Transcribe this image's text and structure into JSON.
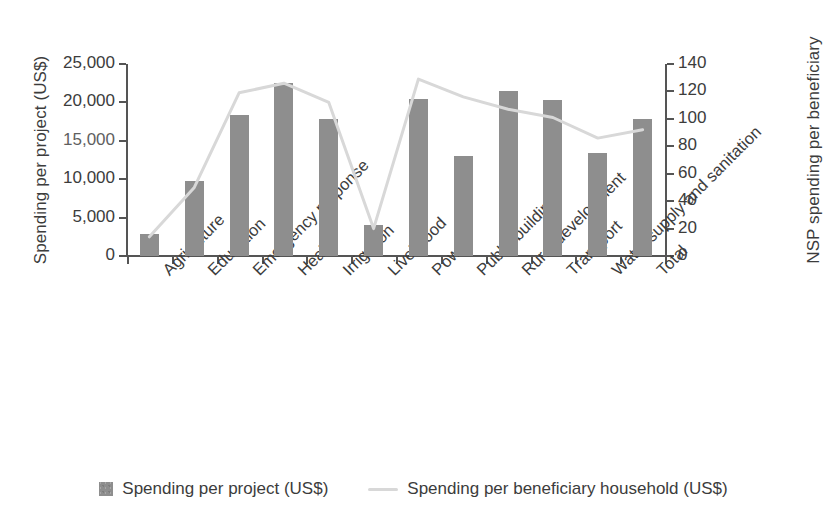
{
  "chart_data": {
    "type": "bar",
    "title": "",
    "categories": [
      "Agriculture",
      "Education",
      "Emergency response",
      "Health",
      "Irrigation",
      "Livelihood",
      "Power",
      "Public building",
      "Rural development",
      "Transport",
      "Water supply and sanitation",
      "Total"
    ],
    "series": [
      {
        "name": "Spending per project (US$)",
        "type": "bar",
        "axis": "left",
        "color": "#8e8e8e",
        "values": [
          2900,
          9800,
          18300,
          22500,
          17800,
          4100,
          20500,
          13000,
          21500,
          20300,
          13400,
          17900
        ]
      },
      {
        "name": "Spending per beneficiary household (US$)",
        "type": "line",
        "axis": "right",
        "color": "#d8d8d8",
        "values": [
          14,
          50,
          119,
          126,
          112,
          20,
          129,
          116,
          107,
          101,
          86,
          92
        ]
      }
    ],
    "xlabel": "",
    "ylabel": "Spending per project (US$)",
    "y2label": "NSP spending per beneficiary HHs (US$)",
    "ylim": [
      0,
      25000
    ],
    "y2lim": [
      0,
      140
    ],
    "yticks": [
      "0",
      "5,000",
      "10,000",
      "15,000",
      "20,000",
      "25,000"
    ],
    "y2ticks": [
      "0",
      "20",
      "40",
      "60",
      "80",
      "100",
      "120",
      "140"
    ],
    "grid": false,
    "legend_position": "bottom"
  },
  "axes": {
    "left_title": "Spending per project (US$)",
    "right_title_line1": "NSP spending per beneficiary",
    "right_title_line2": "HHs (US$)"
  },
  "legend": {
    "items": [
      {
        "label": "Spending per project (US$)",
        "marker": "bar-swatch"
      },
      {
        "label": "Spending per beneficiary household (US$)",
        "marker": "line-swatch"
      }
    ]
  }
}
